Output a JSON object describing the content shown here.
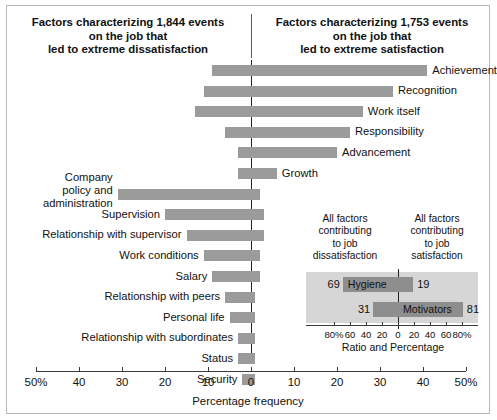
{
  "headers": {
    "left": "Factors characterizing 1,844 events\non the job that\nled to extreme dissatisfaction",
    "right": "Factors characterizing 1,753 events\non the job that\nled to extreme satisfaction"
  },
  "axis": {
    "title": "Percentage frequency",
    "tick_labels": [
      "50%",
      "40",
      "30",
      "20",
      "10",
      "0",
      "10",
      "20",
      "30",
      "40",
      "50%"
    ],
    "tick_values": [
      -50,
      -40,
      -30,
      -20,
      -10,
      0,
      10,
      20,
      30,
      40,
      50
    ],
    "min": -50,
    "max": 50
  },
  "inset": {
    "caption_left": "All factors\ncontributing\nto job\ndissatisfaction",
    "caption_right": "All factors\ncontributing\nto job\nsatisfaction",
    "title": "Ratio and Percentage",
    "tick_labels": [
      "80%",
      "60",
      "40",
      "20",
      "0",
      "20",
      "40",
      "60",
      "80%"
    ],
    "tick_values": [
      -80,
      -60,
      -40,
      -20,
      0,
      20,
      40,
      60,
      80
    ],
    "rows": [
      {
        "name": "Hygiene",
        "left_value": 69,
        "right_value": 19,
        "left_label": "69",
        "right_label": "19",
        "name_side": "left"
      },
      {
        "name": "Motivators",
        "left_value": 31,
        "right_value": 81,
        "left_label": "31",
        "right_label": "81",
        "name_side": "right"
      }
    ]
  },
  "colors": {
    "bar": "#9b9b9b",
    "inset_bar": "#8e8e8e",
    "inset_bg": "#d6d6d6",
    "axis": "#3a3a3a",
    "text": "#111111"
  },
  "chart_data": {
    "type": "bar",
    "xlabel": "Percentage frequency",
    "ylabel": "",
    "xlim": [
      -50,
      50
    ],
    "grid": false,
    "legend": "none",
    "orientation": "horizontal-diverging",
    "categories": [
      "Achievement",
      "Recognition",
      "Work itself",
      "Responsibility",
      "Advancement",
      "Growth",
      "Company policy and administration",
      "Supervision",
      "Relationship with supervisor",
      "Work conditions",
      "Salary",
      "Relationship with peers",
      "Personal life",
      "Relationship with subordinates",
      "Status",
      "Security"
    ],
    "series": [
      {
        "name": "Led to extreme dissatisfaction (left)",
        "values": [
          9,
          11,
          13,
          6,
          3,
          3,
          31,
          20,
          15,
          11,
          9,
          6,
          5,
          3,
          3,
          2
        ]
      },
      {
        "name": "Led to extreme satisfaction (right)",
        "values": [
          41,
          33,
          26,
          23,
          20,
          6,
          2,
          3,
          3,
          2,
          2,
          1,
          1,
          1,
          1,
          1
        ]
      }
    ],
    "inset": {
      "type": "bar",
      "title": "Ratio and Percentage",
      "xlim": [
        -80,
        80
      ],
      "categories": [
        "Hygiene",
        "Motivators"
      ],
      "series": [
        {
          "name": "Contributing to job dissatisfaction",
          "values": [
            69,
            31
          ]
        },
        {
          "name": "Contributing to job satisfaction",
          "values": [
            19,
            81
          ]
        }
      ]
    }
  },
  "rows": [
    {
      "label": "Achievement",
      "left": 9,
      "right": 41,
      "side": "right",
      "multiline": false
    },
    {
      "label": "Recognition",
      "left": 11,
      "right": 33,
      "side": "right",
      "multiline": false
    },
    {
      "label": "Work itself",
      "left": 13,
      "right": 26,
      "side": "right",
      "multiline": false
    },
    {
      "label": "Responsibility",
      "left": 6,
      "right": 23,
      "side": "right",
      "multiline": false
    },
    {
      "label": "Advancement",
      "left": 3,
      "right": 20,
      "side": "right",
      "multiline": false
    },
    {
      "label": "Growth",
      "left": 3,
      "right": 6,
      "side": "right",
      "multiline": false
    },
    {
      "label": "Company\npolicy and\nadministration",
      "left": 31,
      "right": 2,
      "side": "left",
      "multiline": true
    },
    {
      "label": "Supervision",
      "left": 20,
      "right": 3,
      "side": "left",
      "multiline": false
    },
    {
      "label": "Relationship with supervisor",
      "left": 15,
      "right": 3,
      "side": "left",
      "multiline": false
    },
    {
      "label": "Work conditions",
      "left": 11,
      "right": 2,
      "side": "left",
      "multiline": false
    },
    {
      "label": "Salary",
      "left": 9,
      "right": 2,
      "side": "left",
      "multiline": false
    },
    {
      "label": "Relationship with peers",
      "left": 6,
      "right": 1,
      "side": "left",
      "multiline": false
    },
    {
      "label": "Personal life",
      "left": 5,
      "right": 1,
      "side": "left",
      "multiline": false
    },
    {
      "label": "Relationship with subordinates",
      "left": 3,
      "right": 1,
      "side": "left",
      "multiline": false
    },
    {
      "label": "Status",
      "left": 3,
      "right": 1,
      "side": "left",
      "multiline": false
    },
    {
      "label": "Security",
      "left": 2,
      "right": 1,
      "side": "left",
      "multiline": false
    }
  ]
}
